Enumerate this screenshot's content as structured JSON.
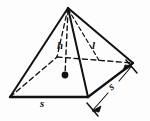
{
  "figure": {
    "name": "square-pyramid",
    "line_color": "#111111",
    "background_color": "#fdfdfd",
    "labels": {
      "base_edge_front": "s",
      "base_edge_right": "s",
      "height": "h",
      "slant_height": "l"
    },
    "geometry": {
      "apex": [
        68,
        8
      ],
      "base_vertex_left": [
        10,
        97
      ],
      "base_vertex_front": [
        88,
        97
      ],
      "base_vertex_right": [
        133,
        63
      ],
      "base_vertex_back_hidden": [
        57,
        57
      ],
      "base_center": [
        65,
        75
      ],
      "solid_edges": [
        "apex-left",
        "apex-front",
        "apex-right",
        "left-front",
        "front-right"
      ],
      "dashed_edges": [
        "apex-center (height h)",
        "apex-back (hidden lateral edge)",
        "left-back (hidden base edge)",
        "back-right (hidden base edge)",
        "apex-midpoint-right-face (slant height l)"
      ],
      "dimension_line": {
        "label": "s",
        "from": [
          92,
          110
        ],
        "to": [
          129,
          68
        ],
        "arrowheads": "both"
      }
    }
  }
}
